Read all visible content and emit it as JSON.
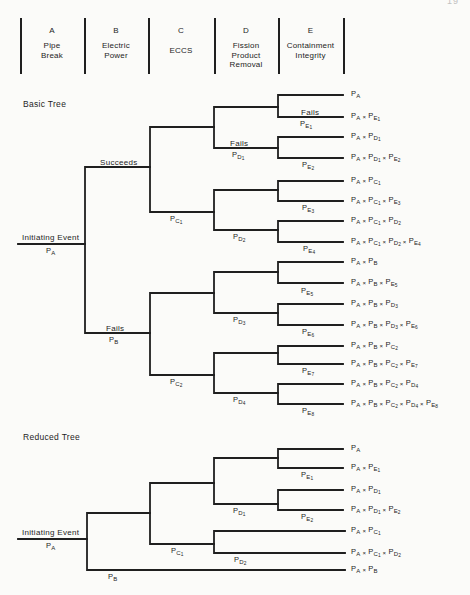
{
  "page": {
    "number": "19"
  },
  "header": {
    "columns": [
      {
        "letter": "A",
        "name": "Pipe\nBreak"
      },
      {
        "letter": "B",
        "name": "Electric\nPower"
      },
      {
        "letter": "C",
        "name": "ECCS"
      },
      {
        "letter": "D",
        "name": "Fission\nProduct\nRemoval"
      },
      {
        "letter": "E",
        "name": "Containment\nIntegrity"
      }
    ]
  },
  "basic_tree": {
    "title": "Basic Tree",
    "initiating_event": {
      "label": "Initiating Event",
      "probability": "P_A"
    },
    "branches": {
      "b_success": "Succeeds",
      "b_fail_word": "Fails",
      "b_fail_prob": "P_B",
      "c1_prob": "P_C1",
      "c2_prob": "P_C2",
      "d1_word": "Fails",
      "d1_prob": "P_D1",
      "d2_prob": "P_D2",
      "d3_prob": "P_D3",
      "d4_prob": "P_D4",
      "e1_word": "Fails",
      "e1_prob": "P_E1",
      "e2_prob": "P_E2",
      "e3_prob": "P_E3",
      "e4_prob": "P_E4",
      "e5_prob": "P_E5",
      "e6_prob": "P_E6",
      "e7_prob": "P_E7",
      "e8_prob": "P_E8"
    },
    "outcomes": [
      "P_A",
      "P_A × P_E1",
      "P_A × P_D1",
      "P_A × P_D1 × P_E2",
      "P_A × P_C1",
      "P_A × P_C1 × P_E3",
      "P_A × P_C1 × P_D2",
      "P_A × P_C1 × P_D2 × P_E4",
      "P_A × P_B",
      "P_A × P_B × P_E5",
      "P_A × P_B × P_D3",
      "P_A × P_B × P_D3 × P_E6",
      "P_A × P_B × P_C2",
      "P_A × P_B × P_C2 × P_E7",
      "P_A × P_B × P_C2 × P_D4",
      "P_A × P_B × P_C2 × P_D4 × P_E8"
    ]
  },
  "reduced_tree": {
    "title": "Reduced Tree",
    "initiating_event": {
      "label": "Initiating Event",
      "probability": "P_A"
    },
    "branches": {
      "b_fail_prob": "P_B",
      "c1_prob": "P_C1",
      "d1_prob": "P_D1",
      "d2_prob": "P_D2",
      "e1_prob": "P_E1",
      "e2_prob": "P_E2"
    },
    "outcomes": [
      "P_A",
      "P_A × P_E1",
      "P_A × P_D1",
      "P_A × P_D1 × P_E2",
      "P_A × P_C1",
      "P_A × P_C1 × P_D2",
      "P_A × P_B"
    ]
  }
}
